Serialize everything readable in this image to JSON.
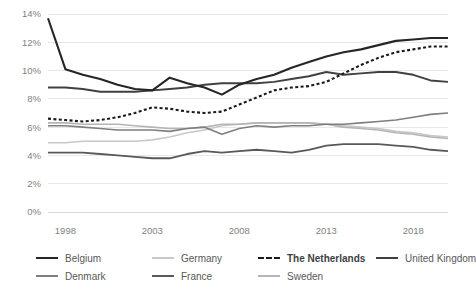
{
  "chart_data": {
    "type": "line",
    "title": "",
    "xlabel": "",
    "ylabel": "",
    "xlim": [
      1997,
      2020
    ],
    "ylim": [
      0,
      14
    ],
    "grid": true,
    "y_ticks": [
      "0%",
      "2%",
      "4%",
      "6%",
      "8%",
      "10%",
      "12%",
      "14%"
    ],
    "y_tick_values": [
      0,
      2,
      4,
      6,
      8,
      10,
      12,
      14
    ],
    "x_ticks": [
      "1998",
      "2003",
      "2008",
      "2013",
      "2018"
    ],
    "x_tick_values": [
      1998,
      2003,
      2008,
      2013,
      2018
    ],
    "x": [
      1997,
      1998,
      1999,
      2000,
      2001,
      2002,
      2003,
      2004,
      2005,
      2006,
      2007,
      2008,
      2009,
      2010,
      2011,
      2012,
      2013,
      2014,
      2015,
      2016,
      2017,
      2018,
      2019,
      2020
    ],
    "legend_position": "bottom",
    "series": [
      {
        "name": "Belgium",
        "color": "#262626",
        "width": 2.1,
        "dash": "none",
        "values": [
          13.7,
          10.1,
          9.7,
          9.4,
          9.0,
          8.7,
          8.6,
          9.5,
          9.1,
          8.8,
          8.3,
          9.0,
          9.4,
          9.7,
          10.2,
          10.6,
          11.0,
          11.3,
          11.5,
          11.8,
          12.1,
          12.2,
          12.3,
          12.3
        ]
      },
      {
        "name": "Denmark",
        "color": "#7f7f7f",
        "width": 1.6,
        "dash": "none",
        "values": [
          6.1,
          6.1,
          6.0,
          5.9,
          5.8,
          5.8,
          5.8,
          5.7,
          5.9,
          6.0,
          5.5,
          5.9,
          6.1,
          6.0,
          6.1,
          6.1,
          6.2,
          6.2,
          6.3,
          6.4,
          6.5,
          6.7,
          6.9,
          7.0
        ]
      },
      {
        "name": "Germany",
        "color": "#c8c8c8",
        "width": 1.6,
        "dash": "none",
        "values": [
          4.9,
          4.9,
          5.0,
          5.0,
          5.0,
          5.0,
          5.1,
          5.3,
          5.6,
          5.8,
          6.1,
          6.2,
          6.3,
          6.3,
          6.3,
          6.3,
          6.2,
          6.1,
          6.0,
          5.9,
          5.7,
          5.6,
          5.4,
          5.3
        ]
      },
      {
        "name": "France",
        "color": "#595959",
        "width": 1.8,
        "dash": "none",
        "values": [
          4.2,
          4.2,
          4.2,
          4.1,
          4.0,
          3.9,
          3.8,
          3.8,
          4.1,
          4.3,
          4.2,
          4.3,
          4.4,
          4.3,
          4.2,
          4.4,
          4.7,
          4.8,
          4.8,
          4.8,
          4.7,
          4.6,
          4.4,
          4.3
        ]
      },
      {
        "name": "The Netherlands",
        "color": "#1a1a1a",
        "width": 2.1,
        "dash": "3 2.4",
        "values": [
          6.6,
          6.5,
          6.4,
          6.5,
          6.7,
          7.0,
          7.4,
          7.3,
          7.1,
          7.0,
          7.1,
          7.6,
          8.1,
          8.6,
          8.8,
          8.9,
          9.2,
          9.8,
          10.4,
          10.9,
          11.3,
          11.5,
          11.7,
          11.7
        ]
      },
      {
        "name": "United Kingdom",
        "color": "#404040",
        "width": 1.9,
        "dash": "none",
        "values": [
          8.8,
          8.8,
          8.7,
          8.5,
          8.5,
          8.5,
          8.6,
          8.7,
          8.8,
          9.0,
          9.1,
          9.1,
          9.1,
          9.2,
          9.4,
          9.6,
          9.9,
          9.7,
          9.8,
          9.9,
          9.9,
          9.7,
          9.3,
          9.2
        ]
      },
      {
        "name": "Sweden",
        "color": "#b5b5b5",
        "width": 1.6,
        "dash": "none",
        "values": [
          6.3,
          6.3,
          6.2,
          6.2,
          6.2,
          6.1,
          6.0,
          5.9,
          5.9,
          6.0,
          6.2,
          6.2,
          6.3,
          6.3,
          6.3,
          6.3,
          6.2,
          6.0,
          5.9,
          5.8,
          5.6,
          5.5,
          5.3,
          5.2
        ]
      }
    ]
  },
  "legend": {
    "rows": [
      [
        {
          "label": "Belgium",
          "color": "#262626",
          "width": 2.4,
          "dash": "solid",
          "emphasis": false
        },
        {
          "label": "Germany",
          "color": "#c8c8c8",
          "width": 2.0,
          "dash": "solid",
          "emphasis": false
        },
        {
          "label": "The Netherlands",
          "color": "#1a1a1a",
          "width": 2.4,
          "dash": "dotted",
          "emphasis": true
        },
        {
          "label": "United Kingdom",
          "color": "#404040",
          "width": 2.2,
          "dash": "solid",
          "emphasis": false
        }
      ],
      [
        {
          "label": "Denmark",
          "color": "#7f7f7f",
          "width": 2.0,
          "dash": "solid",
          "emphasis": false
        },
        {
          "label": "France",
          "color": "#595959",
          "width": 2.2,
          "dash": "solid",
          "emphasis": false
        },
        {
          "label": "Sweden",
          "color": "#b5b5b5",
          "width": 2.0,
          "dash": "solid",
          "emphasis": false
        }
      ]
    ]
  },
  "colors": {
    "grid": "#e8e8e8",
    "axis": "#d9d9d9",
    "tick_text": "#7f7f7f",
    "legend_text": "#595959",
    "background": "#ffffff"
  }
}
